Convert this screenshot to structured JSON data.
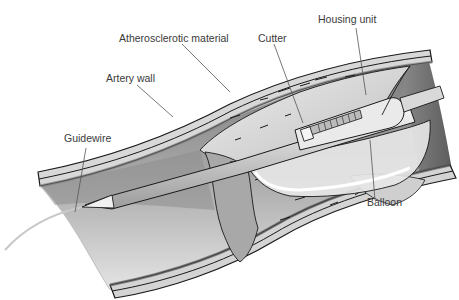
{
  "figure": {
    "labels": {
      "atherosclerotic_material": "Atherosclerotic material",
      "cutter": "Cutter",
      "housing_unit": "Housing unit",
      "artery_wall": "Artery wall",
      "guidewire": "Guidewire",
      "balloon": "Balloon"
    }
  },
  "colors": {
    "outline": "#1a1a1a",
    "wall_light": "#d6d6d6",
    "wall_mid": "#9a9a9a",
    "lumen_dark": "#6e6e6e",
    "lumen_light": "#e6e6e6",
    "plaque": "#c8c8c8",
    "catheter": "#e2e2e2",
    "label_text": "#3a3a3a",
    "leader_line": "#555555"
  }
}
